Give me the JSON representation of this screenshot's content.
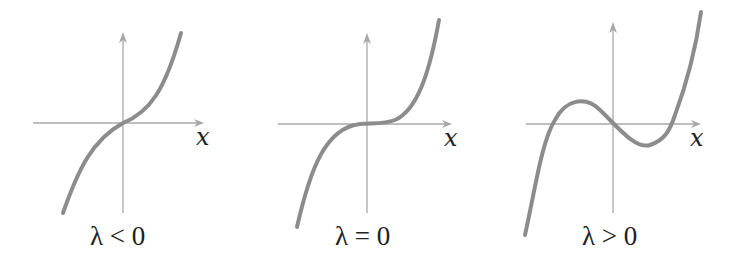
{
  "figure": {
    "panels": [
      {
        "axis_label": "x",
        "caption": "λ < 0",
        "description": "monotonic cubic, single root at origin"
      },
      {
        "axis_label": "x",
        "caption": "λ = 0",
        "description": "cubic with flat inflection at origin"
      },
      {
        "axis_label": "x",
        "caption": "λ > 0",
        "description": "cubic with local max and min, three roots"
      }
    ],
    "colors": {
      "axis": "#a8a8a8",
      "curve": "#8c8c8c",
      "text": "#222222"
    }
  }
}
